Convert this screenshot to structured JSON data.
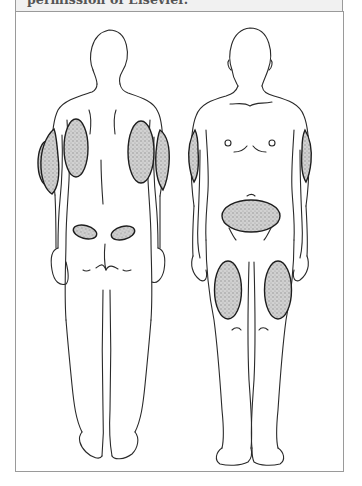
{
  "caption": {
    "text": "permission of Elsevier."
  },
  "figure": {
    "views": [
      {
        "label": "back-view",
        "sites": [
          "left-upper-arm-back",
          "right-upper-arm-back",
          "left-flank",
          "right-flank",
          "left-buttock",
          "right-buttock"
        ]
      },
      {
        "label": "front-view",
        "sites": [
          "right-upper-arm",
          "left-upper-arm",
          "abdomen",
          "right-thigh",
          "left-thigh"
        ]
      }
    ],
    "colors": {
      "outline": "#2a2a2a",
      "shading": "#c9c9c9",
      "border": "#9a9a9a",
      "caption_bg": "#f1f1f1"
    }
  }
}
